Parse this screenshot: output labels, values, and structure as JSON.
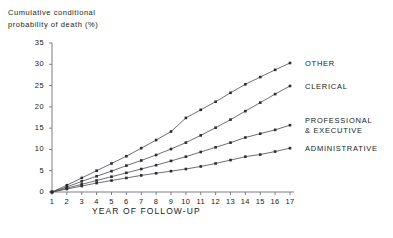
{
  "chart_data": {
    "type": "line",
    "ylabel": "Cumulative conditional probability of death (%)",
    "xlabel": "YEAR OF FOLLOW-UP",
    "xlim": [
      1,
      17
    ],
    "ylim": [
      0,
      35
    ],
    "yticks": [
      0,
      5,
      10,
      15,
      20,
      25,
      30,
      35
    ],
    "xticks": [
      1,
      2,
      3,
      4,
      5,
      6,
      7,
      8,
      9,
      10,
      11,
      12,
      13,
      14,
      15,
      16,
      17
    ],
    "grid": false,
    "legend_position": "right-inline",
    "marker": "square",
    "x": [
      1,
      2,
      3,
      4,
      5,
      6,
      7,
      8,
      9,
      10,
      11,
      12,
      13,
      14,
      15,
      16,
      17
    ],
    "series": [
      {
        "name": "OTHER",
        "values": [
          0.0,
          1.6,
          3.3,
          5.0,
          6.7,
          8.4,
          10.3,
          12.2,
          14.2,
          17.4,
          19.3,
          21.2,
          23.3,
          25.3,
          27.0,
          28.7,
          30.3
        ]
      },
      {
        "name": "CLERICAL",
        "values": [
          0.0,
          1.2,
          2.5,
          3.7,
          4.9,
          6.2,
          7.4,
          8.7,
          10.1,
          11.6,
          13.3,
          15.1,
          17.0,
          19.0,
          21.0,
          23.0,
          24.9
        ]
      },
      {
        "name": "PROFESSIONAL\n& EXECUTIVE",
        "values": [
          0.0,
          0.9,
          1.8,
          2.7,
          3.6,
          4.5,
          5.4,
          6.3,
          7.3,
          8.3,
          9.4,
          10.5,
          11.6,
          12.8,
          13.7,
          14.6,
          15.7
        ]
      },
      {
        "name": "ADMINISTRATIVE",
        "values": [
          0.0,
          0.7,
          1.4,
          2.1,
          2.7,
          3.3,
          3.9,
          4.4,
          4.9,
          5.4,
          6.0,
          6.7,
          7.5,
          8.3,
          8.8,
          9.5,
          10.3
        ]
      }
    ]
  },
  "axes": {
    "y_title_line1": "Cumulative conditional",
    "y_title_line2": "probability of death (%)",
    "x_title": "YEAR OF FOLLOW-UP"
  },
  "legend": {
    "items": [
      {
        "label": "OTHER"
      },
      {
        "label": "CLERICAL"
      },
      {
        "label": "PROFESSIONAL"
      },
      {
        "label": "& EXECUTIVE"
      },
      {
        "label": "ADMINISTRATIVE"
      }
    ]
  },
  "colors": {
    "line": "#4a4a52",
    "axis": "#7d7d85",
    "text": "#1a1a1a",
    "marker": "#2b2b30"
  }
}
